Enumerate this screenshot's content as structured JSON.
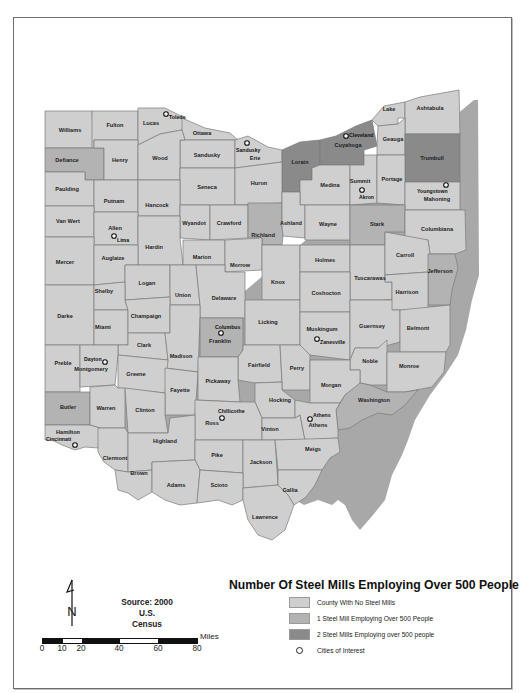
{
  "map": {
    "title": "Number Of Steel Mills Employing Over 500 People",
    "colors": {
      "none": "#cfcfcf",
      "one": "#b3b3b3",
      "two": "#8a8a8a",
      "frame": "#6e6e6e"
    },
    "counties": [
      {
        "name": "Williams",
        "class": 0
      },
      {
        "name": "Fulton",
        "class": 0
      },
      {
        "name": "Lucas",
        "class": 0
      },
      {
        "name": "Ottawa",
        "class": 0
      },
      {
        "name": "Sandusky",
        "class": 0
      },
      {
        "name": "Erie",
        "class": 0
      },
      {
        "name": "Lorain",
        "class": 2
      },
      {
        "name": "Cuyahoga",
        "class": 2
      },
      {
        "name": "Lake",
        "class": 0
      },
      {
        "name": "Ashtabula",
        "class": 0
      },
      {
        "name": "Geauga",
        "class": 0
      },
      {
        "name": "Trumbull",
        "class": 2
      },
      {
        "name": "Defiance",
        "class": 1
      },
      {
        "name": "Henry",
        "class": 0
      },
      {
        "name": "Wood",
        "class": 0
      },
      {
        "name": "Seneca",
        "class": 0
      },
      {
        "name": "Huron",
        "class": 0
      },
      {
        "name": "Medina",
        "class": 0
      },
      {
        "name": "Summit",
        "class": 0
      },
      {
        "name": "Portage",
        "class": 0
      },
      {
        "name": "Mahoning",
        "class": 0
      },
      {
        "name": "Paulding",
        "class": 0
      },
      {
        "name": "Putnam",
        "class": 0
      },
      {
        "name": "Hancock",
        "class": 0
      },
      {
        "name": "Wyandot",
        "class": 0
      },
      {
        "name": "Crawford",
        "class": 0
      },
      {
        "name": "Richland",
        "class": 1
      },
      {
        "name": "Ashland",
        "class": 0
      },
      {
        "name": "Wayne",
        "class": 0
      },
      {
        "name": "Stark",
        "class": 1
      },
      {
        "name": "Columbiana",
        "class": 0
      },
      {
        "name": "Van Wert",
        "class": 0
      },
      {
        "name": "Allen",
        "class": 0
      },
      {
        "name": "Hardin",
        "class": 0
      },
      {
        "name": "Marion",
        "class": 0
      },
      {
        "name": "Morrow",
        "class": 0
      },
      {
        "name": "Knox",
        "class": 0
      },
      {
        "name": "Holmes",
        "class": 0
      },
      {
        "name": "Tuscarawas",
        "class": 0
      },
      {
        "name": "Carroll",
        "class": 0
      },
      {
        "name": "Jefferson",
        "class": 1
      },
      {
        "name": "Mercer",
        "class": 0
      },
      {
        "name": "Auglaize",
        "class": 0
      },
      {
        "name": "Logan",
        "class": 0
      },
      {
        "name": "Union",
        "class": 0
      },
      {
        "name": "Delaware",
        "class": 0
      },
      {
        "name": "Licking",
        "class": 0
      },
      {
        "name": "Coshocton",
        "class": 0
      },
      {
        "name": "Harrison",
        "class": 0
      },
      {
        "name": "Darke",
        "class": 0
      },
      {
        "name": "Shelby",
        "class": 0
      },
      {
        "name": "Miami",
        "class": 0
      },
      {
        "name": "Champaign",
        "class": 0
      },
      {
        "name": "Clark",
        "class": 0
      },
      {
        "name": "Madison",
        "class": 0
      },
      {
        "name": "Franklin",
        "class": 1
      },
      {
        "name": "Fairfield",
        "class": 0
      },
      {
        "name": "Perry",
        "class": 0
      },
      {
        "name": "Muskingum",
        "class": 0
      },
      {
        "name": "Guernsey",
        "class": 0
      },
      {
        "name": "Belmont",
        "class": 0
      },
      {
        "name": "Noble",
        "class": 0
      },
      {
        "name": "Monroe",
        "class": 0
      },
      {
        "name": "Preble",
        "class": 0
      },
      {
        "name": "Montgomery",
        "class": 0
      },
      {
        "name": "Greene",
        "class": 0
      },
      {
        "name": "Fayette",
        "class": 0
      },
      {
        "name": "Pickaway",
        "class": 0
      },
      {
        "name": "Hocking",
        "class": 0
      },
      {
        "name": "Morgan",
        "class": 0
      },
      {
        "name": "Washington",
        "class": 1
      },
      {
        "name": "Butler",
        "class": 1
      },
      {
        "name": "Warren",
        "class": 0
      },
      {
        "name": "Clinton",
        "class": 0
      },
      {
        "name": "Ross",
        "class": 0
      },
      {
        "name": "Vinton",
        "class": 0
      },
      {
        "name": "Athens",
        "class": 0
      },
      {
        "name": "Hamilton",
        "class": 0
      },
      {
        "name": "Clermont",
        "class": 0
      },
      {
        "name": "Highland",
        "class": 0
      },
      {
        "name": "Pike",
        "class": 0
      },
      {
        "name": "Jackson",
        "class": 0
      },
      {
        "name": "Meigs",
        "class": 0
      },
      {
        "name": "Brown",
        "class": 0
      },
      {
        "name": "Adams",
        "class": 0
      },
      {
        "name": "Scioto",
        "class": 0
      },
      {
        "name": "Gallia",
        "class": 0
      },
      {
        "name": "Lawrence",
        "class": 0
      }
    ],
    "cities": [
      "Toledo",
      "Sandusky",
      "Cleveland",
      "Akron",
      "Youngstown",
      "Lima",
      "Columbus",
      "Zanesville",
      "Dayton",
      "Chillicothe",
      "Athens",
      "Cincinnati"
    ]
  },
  "legend": {
    "title": "Number Of Steel Mills Employing Over 500 People",
    "items": [
      {
        "label": "County With No Steel Mills"
      },
      {
        "label": "1 Steel Mill Employing Over 500 People"
      },
      {
        "label": "2 Steel Mills Employing over 500 people"
      },
      {
        "label": "Cities of Interest"
      }
    ]
  },
  "source": {
    "line1": "Source: 2000 U.S.",
    "line2": "Census"
  },
  "scale": {
    "unit": "Miles",
    "ticks": [
      "0",
      "10",
      "20",
      "40",
      "60",
      "80"
    ]
  },
  "north_arrow": {
    "label": "N"
  },
  "labels": {
    "Williams": "Williams",
    "Fulton": "Fulton",
    "Lucas": "Lucas",
    "Ottawa": "Ottawa",
    "Sandusky": "Sandusky",
    "Erie": "Erie",
    "Lorain": "Lorain",
    "Cuyahoga": "Cuyahoga",
    "Lake": "Lake",
    "Ashtabula": "Ashtabula",
    "Geauga": "Geauga",
    "Trumbull": "Trumbull",
    "Defiance": "Defiance",
    "Henry": "Henry",
    "Wood": "Wood",
    "Seneca": "Seneca",
    "Huron": "Huron",
    "Medina": "Medina",
    "Summit": "Summit",
    "Portage": "Portage",
    "Mahoning": "Mahoning",
    "Paulding": "Paulding",
    "Putnam": "Putnam",
    "Hancock": "Hancock",
    "Wyandot": "Wyandot",
    "Crawford": "Crawford",
    "Richland": "Richland",
    "Ashland": "Ashland",
    "Wayne": "Wayne",
    "Stark": "Stark",
    "Columbiana": "Columbiana",
    "VanWert": "Van Wert",
    "Allen": "Allen",
    "Hardin": "Hardin",
    "Marion": "Marion",
    "Morrow": "Morrow",
    "Knox": "Knox",
    "Holmes": "Holmes",
    "Tuscarawas": "Tuscarawas",
    "Carroll": "Carroll",
    "Jefferson": "Jefferson",
    "Mercer": "Mercer",
    "Auglaize": "Auglaize",
    "Logan": "Logan",
    "Union": "Union",
    "Delaware": "Delaware",
    "Licking": "Licking",
    "Coshocton": "Coshocton",
    "Harrison": "Harrison",
    "Darke": "Darke",
    "Shelby": "Shelby",
    "Miami": "Miami",
    "Champaign": "Champaign",
    "Clark": "Clark",
    "Madison": "Madison",
    "Franklin": "Franklin",
    "Fairfield": "Fairfield",
    "Perry": "Perry",
    "Muskingum": "Muskingum",
    "Guernsey": "Guernsey",
    "Belmont": "Belmont",
    "Noble": "Noble",
    "Monroe": "Monroe",
    "Preble": "Preble",
    "Montgomery": "Montgomery",
    "Greene": "Greene",
    "Fayette": "Fayette",
    "Pickaway": "Pickaway",
    "Hocking": "Hocking",
    "Morgan": "Morgan",
    "Washington": "Washington",
    "Butler": "Butler",
    "Warren": "Warren",
    "Clinton": "Clinton",
    "Ross": "Ross",
    "Vinton": "Vinton",
    "Athens": "Athens",
    "Hamilton": "Hamilton",
    "Clermont": "Clermont",
    "Highland": "Highland",
    "Pike": "Pike",
    "Jackson": "Jackson",
    "Meigs": "Meigs",
    "Brown": "Brown",
    "Adams": "Adams",
    "Scioto": "Scioto",
    "Gallia": "Gallia",
    "Lawrence": "Lawrence",
    "cToledo": "Toledo",
    "cSandusky": "Sandusky",
    "cCleveland": "Cleveland",
    "cAkron": "Akron",
    "cYoungstown": "Youngstown",
    "cLima": "Lima",
    "cColumbus": "Columbus",
    "cZanesville": "Zanesville",
    "cDayton": "Dayton",
    "cChillicothe": "Chillicothe",
    "cAthens": "Athens",
    "cCincinnati": "Cincinnati"
  }
}
